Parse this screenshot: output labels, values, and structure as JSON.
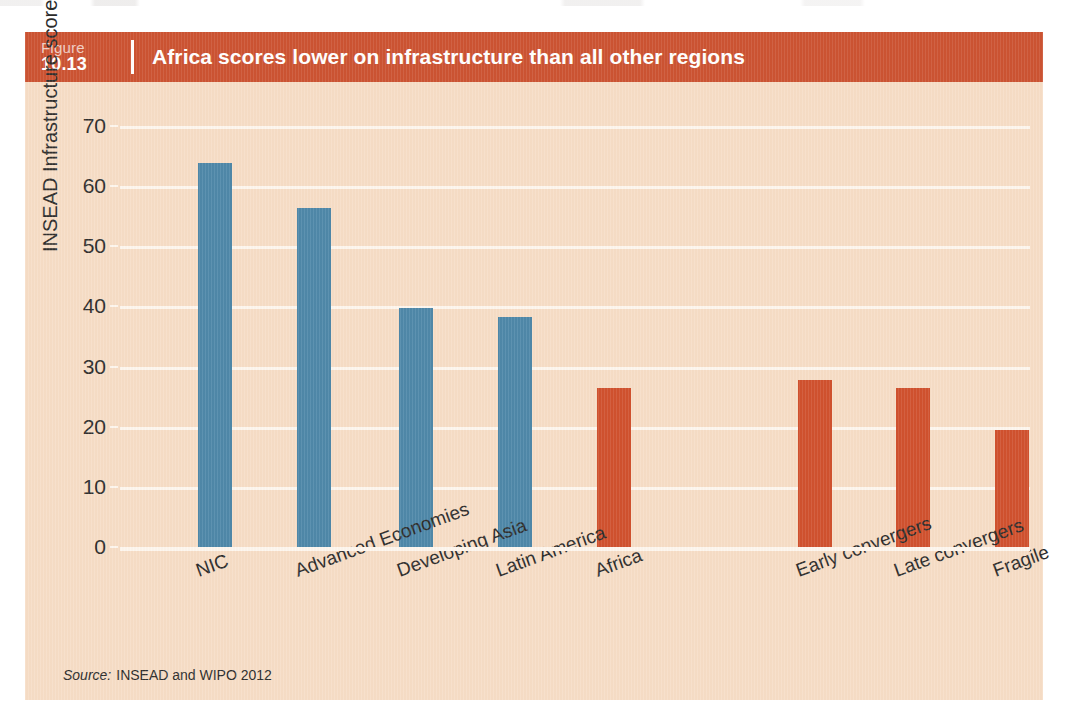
{
  "figure": {
    "label_word": "Figure",
    "number": "10.13",
    "title": "Africa scores lower on infrastructure than all other regions",
    "source_word": "Source:",
    "source_text": "INSEAD and WIPO 2012",
    "header_color": "#cb5130",
    "panel_color": "#f6ddc6",
    "gridline_color": "#fdf6ee"
  },
  "chart_data": {
    "type": "bar",
    "title": "Africa scores lower on infrastructure than all other regions",
    "xlabel": "",
    "ylabel": "INSEAD Infrastructure score",
    "ylim": [
      0,
      70
    ],
    "ytick_step": 10,
    "yticks": [
      70,
      60,
      50,
      40,
      30,
      20,
      10,
      0
    ],
    "grid": true,
    "legend": "none",
    "categories": [
      "NIC",
      "Advanced Economies",
      "Developing Asia",
      "Latin America",
      "Africa",
      "Early convergers",
      "Late convergers",
      "Fragile"
    ],
    "values": [
      63.8,
      56.3,
      39.7,
      38.2,
      26.4,
      27.7,
      26.5,
      19.4
    ],
    "bar_colors": [
      "#4b86a8",
      "#4b86a8",
      "#4b86a8",
      "#4b86a8",
      "#cf4f2c",
      "#cf4f2c",
      "#cf4f2c",
      "#cf4f2c"
    ],
    "bar_slot_centers_px": [
      95,
      194,
      296,
      395,
      494,
      695,
      793,
      892
    ],
    "bar_width_px": 34,
    "color_groups": [
      {
        "name": "regions",
        "color": "#4b86a8"
      },
      {
        "name": "africa-groupings",
        "color": "#cf4f2c"
      }
    ]
  }
}
